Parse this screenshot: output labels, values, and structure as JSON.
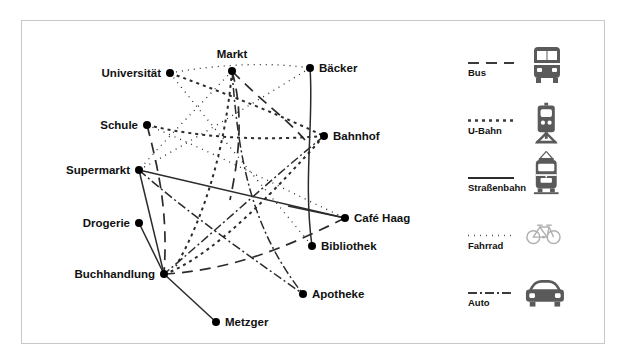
{
  "figure": {
    "title": "",
    "border_color": "#c8c8c8",
    "background": "#ffffff"
  },
  "chart_data": {
    "type": "diagram",
    "diagram_kind": "multimodal-transport-network-graph",
    "title": "",
    "xlabel": "",
    "ylabel": "",
    "grid": false,
    "legend_position": "right",
    "nodes": [
      {
        "id": "universitaet",
        "label": "Universität",
        "x": 170,
        "y": 73,
        "label_anchor": "end",
        "label_dx": -9,
        "label_dy": 4
      },
      {
        "id": "markt",
        "label": "Markt",
        "x": 232,
        "y": 71,
        "label_anchor": "middle",
        "label_dx": 0,
        "label_dy": -13
      },
      {
        "id": "baecker",
        "label": "Bäcker",
        "x": 310,
        "y": 68,
        "label_anchor": "start",
        "label_dx": 9,
        "label_dy": 4
      },
      {
        "id": "schule",
        "label": "Schule",
        "x": 147,
        "y": 125,
        "label_anchor": "end",
        "label_dx": -9,
        "label_dy": 4
      },
      {
        "id": "bahnhof",
        "label": "Bahnhof",
        "x": 324,
        "y": 136,
        "label_anchor": "start",
        "label_dx": 9,
        "label_dy": 4
      },
      {
        "id": "supermarkt",
        "label": "Supermarkt",
        "x": 139,
        "y": 170,
        "label_anchor": "end",
        "label_dx": -9,
        "label_dy": 4
      },
      {
        "id": "cafe_haag",
        "label": "Café Haag",
        "x": 345,
        "y": 218,
        "label_anchor": "start",
        "label_dx": 9,
        "label_dy": 4
      },
      {
        "id": "drogerie",
        "label": "Drogerie",
        "x": 139,
        "y": 223,
        "label_anchor": "end",
        "label_dx": -9,
        "label_dy": 4
      },
      {
        "id": "bibliothek",
        "label": "Bibliothek",
        "x": 312,
        "y": 246,
        "label_anchor": "start",
        "label_dx": 9,
        "label_dy": 4
      },
      {
        "id": "buchhandlung",
        "label": "Buchhandlung",
        "x": 164,
        "y": 274,
        "label_anchor": "end",
        "label_dx": -9,
        "label_dy": 4
      },
      {
        "id": "apotheke",
        "label": "Apotheke",
        "x": 303,
        "y": 294,
        "label_anchor": "start",
        "label_dx": 9,
        "label_dy": 4
      },
      {
        "id": "metzger",
        "label": "Metzger",
        "x": 216,
        "y": 322,
        "label_anchor": "start",
        "label_dx": 9,
        "label_dy": 4
      }
    ],
    "edges": [
      {
        "from": "supermarkt",
        "to": "cafe_haag",
        "mode": "strassenbahn",
        "path": "M139,170 L345,218"
      },
      {
        "from": "baecker",
        "to": "bibliothek",
        "mode": "strassenbahn",
        "path": "M310,68 C314,120 303,180 312,246"
      },
      {
        "from": "drogerie",
        "to": "buchhandlung",
        "mode": "strassenbahn",
        "path": "M139,223 L164,274"
      },
      {
        "from": "buchhandlung",
        "to": "metzger",
        "mode": "strassenbahn",
        "path": "M164,274 L216,322"
      },
      {
        "from": "supermarkt",
        "to": "buchhandlung",
        "mode": "strassenbahn",
        "path": "M139,170 L164,274"
      },
      {
        "from": "cafe_haag",
        "to": "bahnhof",
        "mode": "strassenbahn",
        "path": "M345,218 L288,206"
      },
      {
        "from": "markt",
        "to": "buchhandlung",
        "mode": "bus",
        "path": "M232,71 C246,120 236,170 230,200"
      },
      {
        "from": "schule",
        "to": "buchhandlung",
        "mode": "bus",
        "path": "M147,125 C160,175 168,215 164,274"
      },
      {
        "from": "cafe_haag",
        "to": "buchhandlung",
        "mode": "bus",
        "path": "M345,218 C300,240 240,270 164,274"
      },
      {
        "from": "markt",
        "to": "bahnhof",
        "mode": "bus",
        "path": "M232,71 C260,100 286,118 305,140"
      },
      {
        "from": "universitaet",
        "to": "bahnhof",
        "mode": "ubahn",
        "path": "M170,73 C230,95 280,115 324,136"
      },
      {
        "from": "schule",
        "to": "bahnhof",
        "mode": "ubahn",
        "path": "M147,125 C210,140 270,140 324,136"
      },
      {
        "from": "markt",
        "to": "buchhandlung",
        "mode": "ubahn",
        "path": "M232,71 C226,140 208,210 176,266"
      },
      {
        "from": "bahnhof",
        "to": "buchhandlung",
        "mode": "ubahn",
        "path": "M324,136 C280,185 220,250 170,272"
      },
      {
        "from": "universitaet",
        "to": "baecker",
        "mode": "fahrrad",
        "path": "M170,73 C220,64 270,62 310,68"
      },
      {
        "from": "universitaet",
        "to": "bibliothek",
        "mode": "fahrrad",
        "path": "M170,73 C215,130 270,195 312,246"
      },
      {
        "from": "markt",
        "to": "supermarkt",
        "mode": "fahrrad",
        "path": "M232,71 C200,105 165,140 139,170"
      },
      {
        "from": "baecker",
        "to": "supermarkt",
        "mode": "fahrrad",
        "path": "M310,68 C250,105 185,145 139,170"
      },
      {
        "from": "schule",
        "to": "cafe_haag",
        "mode": "fahrrad",
        "path": "M147,125 C220,155 295,195 345,218"
      },
      {
        "from": "markt",
        "to": "apotheke",
        "mode": "auto",
        "path": "M232,71 C238,150 248,225 303,294"
      },
      {
        "from": "supermarkt",
        "to": "apotheke",
        "mode": "auto",
        "path": "M139,170 C190,215 255,260 303,294"
      },
      {
        "from": "bahnhof",
        "to": "buchhandlung",
        "mode": "auto",
        "path": "M324,136 C270,180 205,240 164,274"
      }
    ],
    "legend": [
      {
        "mode": "bus",
        "label": "Bus",
        "line_style": "dashed",
        "icon": "bus-icon"
      },
      {
        "mode": "ubahn",
        "label": "U-Bahn",
        "line_style": "short-dashed",
        "icon": "train-icon"
      },
      {
        "mode": "strassenbahn",
        "label": "Straßenbahn",
        "line_style": "solid",
        "icon": "tram-icon"
      },
      {
        "mode": "fahrrad",
        "label": "Fahrrad",
        "line_style": "dotted",
        "icon": "bicycle-icon"
      },
      {
        "mode": "auto",
        "label": "Auto",
        "line_style": "dash-dot",
        "icon": "car-icon"
      }
    ],
    "styles": {
      "bus": {
        "color": "#3a3a3a",
        "width": 1.7,
        "dasharray": "11 7"
      },
      "ubahn": {
        "color": "#3a3a3a",
        "width": 2.0,
        "dasharray": "3 4"
      },
      "strassenbahn": {
        "color": "#2b2b2b",
        "width": 1.5,
        "dasharray": ""
      },
      "fahrrad": {
        "color": "#5a5a5a",
        "width": 1.3,
        "dasharray": "1 5"
      },
      "auto": {
        "color": "#3a3a3a",
        "width": 1.5,
        "dasharray": "9 3 2 3"
      }
    },
    "node_radius": 4,
    "colors": {
      "node": "#000000",
      "label": "#111111",
      "icon_dark": "#555555",
      "icon_light": "#a8a8a8"
    }
  }
}
